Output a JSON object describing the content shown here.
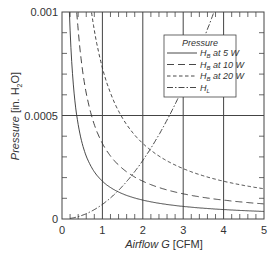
{
  "chart_data": {
    "type": "line",
    "title": "",
    "xlabel": "Airflow G [CFM]",
    "xlabel_italic_part": "Airflow G",
    "xlabel_unit": "[CFM]",
    "ylabel": "Pressure [in. H2O]",
    "ylabel_italic_part": "Pressure",
    "ylabel_unit_prefix": "[in. H",
    "ylabel_unit_sub": "2",
    "ylabel_unit_suffix": "O]",
    "xlim": [
      0,
      5
    ],
    "ylim": [
      0,
      0.001
    ],
    "x_ticks": [
      "0",
      "1",
      "2",
      "3",
      "4",
      "5"
    ],
    "y_ticks": [
      "0",
      "0.0005",
      "0.001"
    ],
    "grid": "major gridlines at x=1..4 and y=0.0005",
    "legend": {
      "title": "Pressure",
      "position": "upper right",
      "entries": [
        "H_B at 5 W",
        "H_B at 10 W",
        "H_B at 20 W",
        "H_L"
      ]
    },
    "series": [
      {
        "name": "H_B at 5 W",
        "style": "solid",
        "x": [
          0.18,
          0.25,
          0.35,
          0.5,
          0.75,
          1,
          1.5,
          2,
          3,
          4,
          5
        ],
        "y": [
          0.001,
          0.00073,
          0.00052,
          0.000365,
          0.00024,
          0.00018,
          0.00012,
          9e-05,
          6e-05,
          4.5e-05,
          3.6e-05
        ]
      },
      {
        "name": "H_B at 10 W",
        "style": "long-dash",
        "x": [
          0.36,
          0.5,
          0.7,
          1,
          1.5,
          2,
          3,
          4,
          5
        ],
        "y": [
          0.001,
          0.00073,
          0.00052,
          0.00037,
          0.00024,
          0.00018,
          0.00012,
          9e-05,
          7.4e-05
        ]
      },
      {
        "name": "H_B at 20 W",
        "style": "short-dash",
        "x": [
          0.73,
          1,
          1.4,
          2,
          2.5,
          3,
          4,
          5
        ],
        "y": [
          0.001,
          0.00074,
          0.00052,
          0.00037,
          0.00029,
          0.00024,
          0.00018,
          0.000148
        ]
      },
      {
        "name": "H_L",
        "style": "dash-dot",
        "x": [
          0.2,
          0.5,
          1,
          1.5,
          2,
          2.5,
          3,
          3.5,
          3.76
        ],
        "y": [
          3e-06,
          1.8e-05,
          7e-05,
          0.00016,
          0.00028,
          0.00044,
          0.00064,
          0.00087,
          0.001
        ]
      }
    ]
  },
  "legend_labels": {
    "title": "Pressure",
    "items": [
      {
        "main": "H",
        "sub": "B",
        "suffix": " at 5 W"
      },
      {
        "main": "H",
        "sub": "B",
        "suffix": " at 10 W"
      },
      {
        "main": "H",
        "sub": "B",
        "suffix": " at 20 W"
      },
      {
        "main": "H",
        "sub": "L",
        "suffix": ""
      }
    ]
  },
  "colors": {
    "line": "#333333",
    "grid": "#444444",
    "background": "#ffffff"
  }
}
